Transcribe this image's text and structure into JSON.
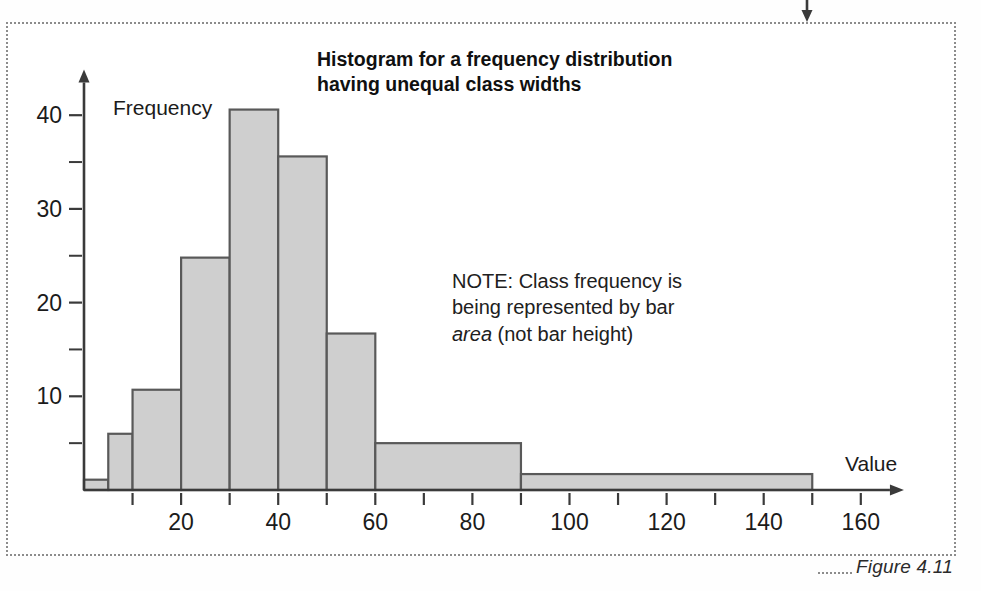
{
  "figure": {
    "caption": "Figure 4.11",
    "top_marker_icon": "down-arrow-icon"
  },
  "chart_data": {
    "type": "bar",
    "title": "Histogram for a frequency distribution having unequal class widths",
    "title_lines": [
      "Histogram for a frequency distribution",
      "having unequal class widths"
    ],
    "xlabel": "Value",
    "ylabel": "Frequency",
    "annotation": {
      "lines": [
        "NOTE: Class frequency is",
        "being represented by bar",
        "area (not bar height)"
      ],
      "prefix": "NOTE: Class frequency is being represented by bar ",
      "italic_word": "area",
      "suffix": " (not bar height)"
    },
    "xlim": [
      0,
      165
    ],
    "ylim": [
      0,
      43
    ],
    "xticks": [
      0,
      10,
      20,
      30,
      40,
      50,
      60,
      70,
      80,
      90,
      100,
      110,
      120,
      130,
      140,
      150,
      160
    ],
    "xticklabels": [
      "20",
      "40",
      "60",
      "80",
      "100",
      "120",
      "140",
      "160"
    ],
    "xticklabel_values": [
      20,
      40,
      60,
      80,
      100,
      120,
      140,
      160
    ],
    "yticks_major": [
      10,
      20,
      30,
      40
    ],
    "yticks_minor": [
      5,
      15,
      25,
      35
    ],
    "yticklabels": [
      "10",
      "20",
      "30",
      "40"
    ],
    "grid": false,
    "legend": "none",
    "bar_fill": "#cfcfcf",
    "bar_edge": "#595959",
    "axis_color": "#3a3a3a",
    "bins": [
      {
        "start": 0,
        "end": 5,
        "height": 1.1
      },
      {
        "start": 5,
        "end": 10,
        "height": 6.0
      },
      {
        "start": 10,
        "end": 20,
        "height": 10.7
      },
      {
        "start": 20,
        "end": 30,
        "height": 24.8
      },
      {
        "start": 30,
        "end": 40,
        "height": 40.6
      },
      {
        "start": 40,
        "end": 50,
        "height": 35.6
      },
      {
        "start": 50,
        "end": 60,
        "height": 16.7
      },
      {
        "start": 60,
        "end": 90,
        "height": 5.0
      },
      {
        "start": 90,
        "end": 150,
        "height": 1.7
      }
    ]
  }
}
